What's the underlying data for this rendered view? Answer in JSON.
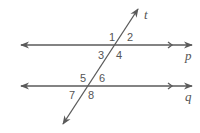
{
  "diagram": {
    "colors": {
      "line": "#5a5a5a",
      "text": "#555555",
      "background": "#ffffff"
    },
    "lines": {
      "p": {
        "label": "p",
        "description": "parallel line p"
      },
      "q": {
        "label": "q",
        "description": "parallel line q"
      },
      "t": {
        "label": "t",
        "description": "transversal t"
      }
    },
    "angles": [
      {
        "id": "1",
        "label": "1"
      },
      {
        "id": "2",
        "label": "2"
      },
      {
        "id": "3",
        "label": "3"
      },
      {
        "id": "4",
        "label": "4"
      },
      {
        "id": "5",
        "label": "5"
      },
      {
        "id": "6",
        "label": "6"
      },
      {
        "id": "7",
        "label": "7"
      },
      {
        "id": "8",
        "label": "8"
      }
    ]
  }
}
